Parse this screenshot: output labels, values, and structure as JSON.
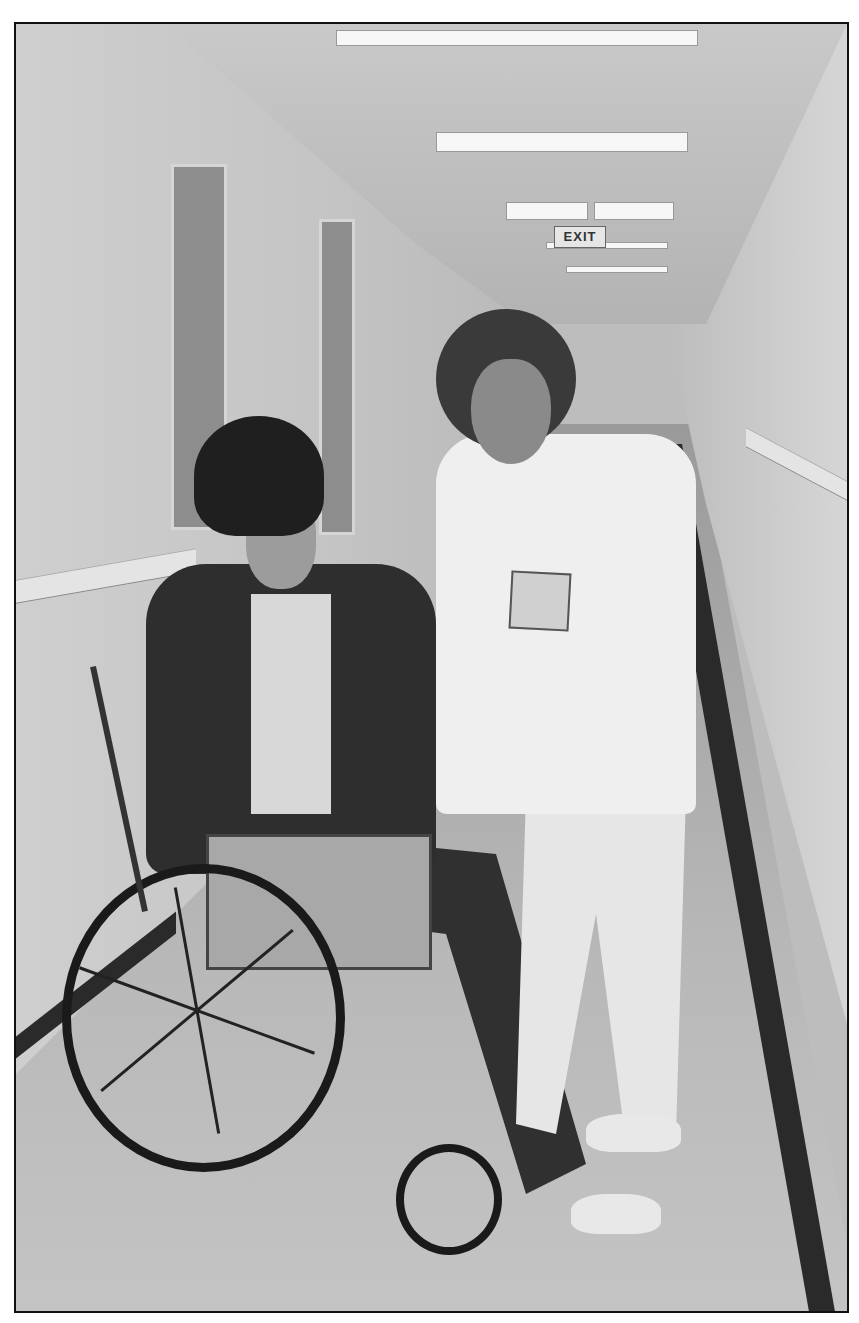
{
  "photo": {
    "description": "Black-and-white photograph of a nurse in white scrubs assisting a man in a wheelchair wearing a black knit cap in a hospital corridor",
    "signage": {
      "exit_sign": "EXIT"
    },
    "style": {
      "mode": "grayscale",
      "border_color": "#111111",
      "margin_color": "#ffffff"
    }
  }
}
